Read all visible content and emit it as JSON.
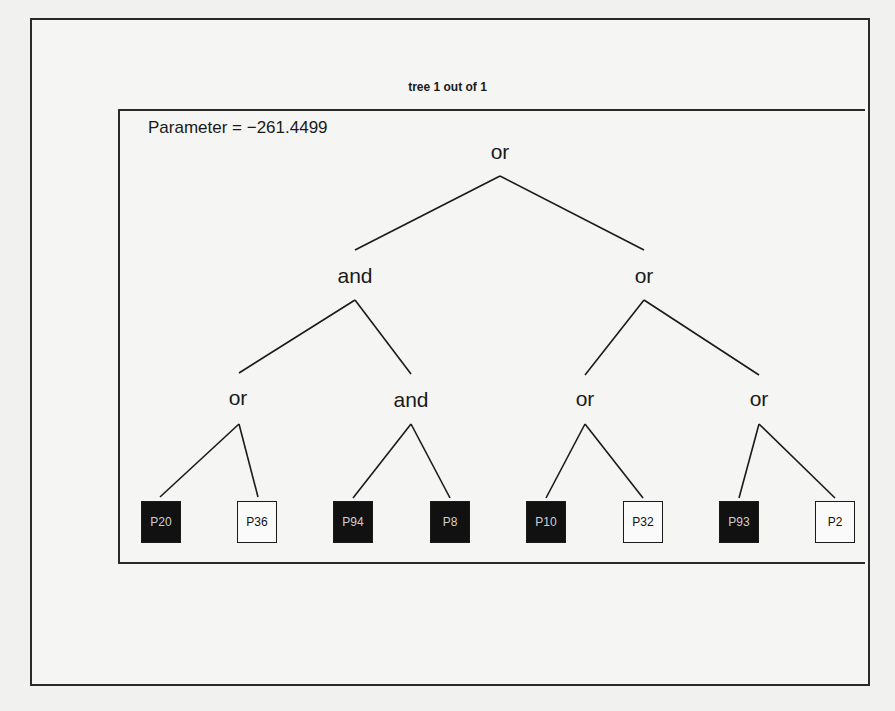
{
  "title": "tree 1 out of 1",
  "parameter_label": "Parameter = −261.4499",
  "colors": {
    "dark_leaf": "#111111",
    "light_leaf": "#fafafa",
    "line": "#1a1a1a"
  },
  "tree": {
    "root": {
      "id": "n0",
      "label": "or",
      "x": 500,
      "y": 152
    },
    "internal_nodes": [
      {
        "id": "n1",
        "label": "and",
        "x": 355,
        "y": 276,
        "parent": "n0"
      },
      {
        "id": "n2",
        "label": "or",
        "x": 644,
        "y": 276,
        "parent": "n0"
      },
      {
        "id": "n3",
        "label": "or",
        "x": 238,
        "y": 398,
        "parent": "n1"
      },
      {
        "id": "n4",
        "label": "and",
        "x": 411,
        "y": 400,
        "parent": "n1"
      },
      {
        "id": "n5",
        "label": "or",
        "x": 585,
        "y": 399,
        "parent": "n2"
      },
      {
        "id": "n6",
        "label": "or",
        "x": 759,
        "y": 399,
        "parent": "n2"
      }
    ],
    "leaves": [
      {
        "label": "P20",
        "style": "dark",
        "x": 141,
        "parent": "n3"
      },
      {
        "label": "P36",
        "style": "light",
        "x": 237,
        "parent": "n3"
      },
      {
        "label": "P94",
        "style": "dark",
        "x": 333,
        "parent": "n4"
      },
      {
        "label": "P8",
        "style": "dark",
        "x": 430,
        "parent": "n4"
      },
      {
        "label": "P10",
        "style": "dark",
        "x": 526,
        "parent": "n5"
      },
      {
        "label": "P32",
        "style": "light",
        "x": 623,
        "parent": "n5"
      },
      {
        "label": "P93",
        "style": "dark",
        "x": 719,
        "parent": "n6"
      },
      {
        "label": "P2",
        "style": "light",
        "x": 815,
        "parent": "n6"
      }
    ],
    "edges": [
      {
        "from": [
          500,
          176
        ],
        "to": [
          355,
          250
        ]
      },
      {
        "from": [
          500,
          176
        ],
        "to": [
          644,
          250
        ]
      },
      {
        "from": [
          355,
          300
        ],
        "to": [
          239,
          373
        ]
      },
      {
        "from": [
          355,
          300
        ],
        "to": [
          411,
          374
        ]
      },
      {
        "from": [
          644,
          300
        ],
        "to": [
          585,
          375
        ]
      },
      {
        "from": [
          644,
          300
        ],
        "to": [
          759,
          375
        ]
      },
      {
        "from": [
          239,
          424
        ],
        "to": [
          160,
          497
        ]
      },
      {
        "from": [
          239,
          424
        ],
        "to": [
          258,
          497
        ]
      },
      {
        "from": [
          411,
          424
        ],
        "to": [
          353,
          498
        ]
      },
      {
        "from": [
          411,
          424
        ],
        "to": [
          450,
          498
        ]
      },
      {
        "from": [
          585,
          424
        ],
        "to": [
          546,
          498
        ]
      },
      {
        "from": [
          585,
          424
        ],
        "to": [
          643,
          498
        ]
      },
      {
        "from": [
          759,
          424
        ],
        "to": [
          739,
          498
        ]
      },
      {
        "from": [
          759,
          424
        ],
        "to": [
          835,
          498
        ]
      }
    ]
  }
}
